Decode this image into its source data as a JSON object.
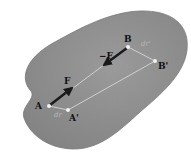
{
  "diagram": {
    "colors": {
      "body_fill": "#8f8f8f",
      "body_edge": "#7a7a7a",
      "line": "#d6d6d6",
      "arrow": "#1a1a1a",
      "point": "#f2f2f2",
      "label_dark": "#111111",
      "label_light": "#b8b8b8"
    },
    "points": {
      "A": {
        "label": "A",
        "x": 49,
        "y": 106
      },
      "A_prime": {
        "label": "A'",
        "x": 68,
        "y": 110
      },
      "B": {
        "label": "B",
        "x": 128,
        "y": 47
      },
      "B_prime": {
        "label": "B'",
        "x": 155,
        "y": 61
      }
    },
    "forces": {
      "F": {
        "label": "F"
      },
      "minus_F": {
        "label": "−F"
      }
    },
    "displacements": {
      "dr": {
        "label": "dr"
      },
      "dr_prime": {
        "label": "dr'"
      }
    }
  }
}
